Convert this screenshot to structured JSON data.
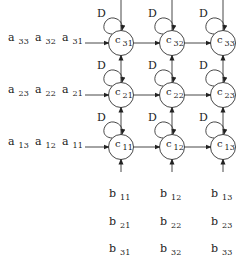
{
  "diagram": {
    "type": "systolic-array-matrix-multiply",
    "delay_label": "D",
    "nodes": [
      {
        "base": "c",
        "sub": "31",
        "row": 0,
        "col": 0
      },
      {
        "base": "c",
        "sub": "32",
        "row": 0,
        "col": 1
      },
      {
        "base": "c",
        "sub": "33",
        "row": 0,
        "col": 2
      },
      {
        "base": "c",
        "sub": "21",
        "row": 1,
        "col": 0
      },
      {
        "base": "c",
        "sub": "22",
        "row": 1,
        "col": 1
      },
      {
        "base": "c",
        "sub": "23",
        "row": 1,
        "col": 2
      },
      {
        "base": "c",
        "sub": "11",
        "row": 2,
        "col": 0
      },
      {
        "base": "c",
        "sub": "12",
        "row": 2,
        "col": 1
      },
      {
        "base": "c",
        "sub": "13",
        "row": 2,
        "col": 2
      }
    ],
    "a_inputs": [
      {
        "row": 0,
        "items": [
          {
            "base": "a",
            "sub": "33"
          },
          {
            "base": "a",
            "sub": "32"
          },
          {
            "base": "a",
            "sub": "31"
          }
        ]
      },
      {
        "row": 1,
        "items": [
          {
            "base": "a",
            "sub": "23"
          },
          {
            "base": "a",
            "sub": "22"
          },
          {
            "base": "a",
            "sub": "21"
          }
        ]
      },
      {
        "row": 2,
        "items": [
          {
            "base": "a",
            "sub": "13"
          },
          {
            "base": "a",
            "sub": "12"
          },
          {
            "base": "a",
            "sub": "11"
          }
        ]
      }
    ],
    "b_inputs": [
      {
        "col": 0,
        "items": [
          {
            "base": "b",
            "sub": "11"
          },
          {
            "base": "b",
            "sub": "21"
          },
          {
            "base": "b",
            "sub": "31"
          }
        ]
      },
      {
        "col": 1,
        "items": [
          {
            "base": "b",
            "sub": "12"
          },
          {
            "base": "b",
            "sub": "22"
          },
          {
            "base": "b",
            "sub": "32"
          }
        ]
      },
      {
        "col": 2,
        "items": [
          {
            "base": "b",
            "sub": "13"
          },
          {
            "base": "b",
            "sub": "23"
          },
          {
            "base": "b",
            "sub": "33"
          }
        ]
      }
    ]
  }
}
